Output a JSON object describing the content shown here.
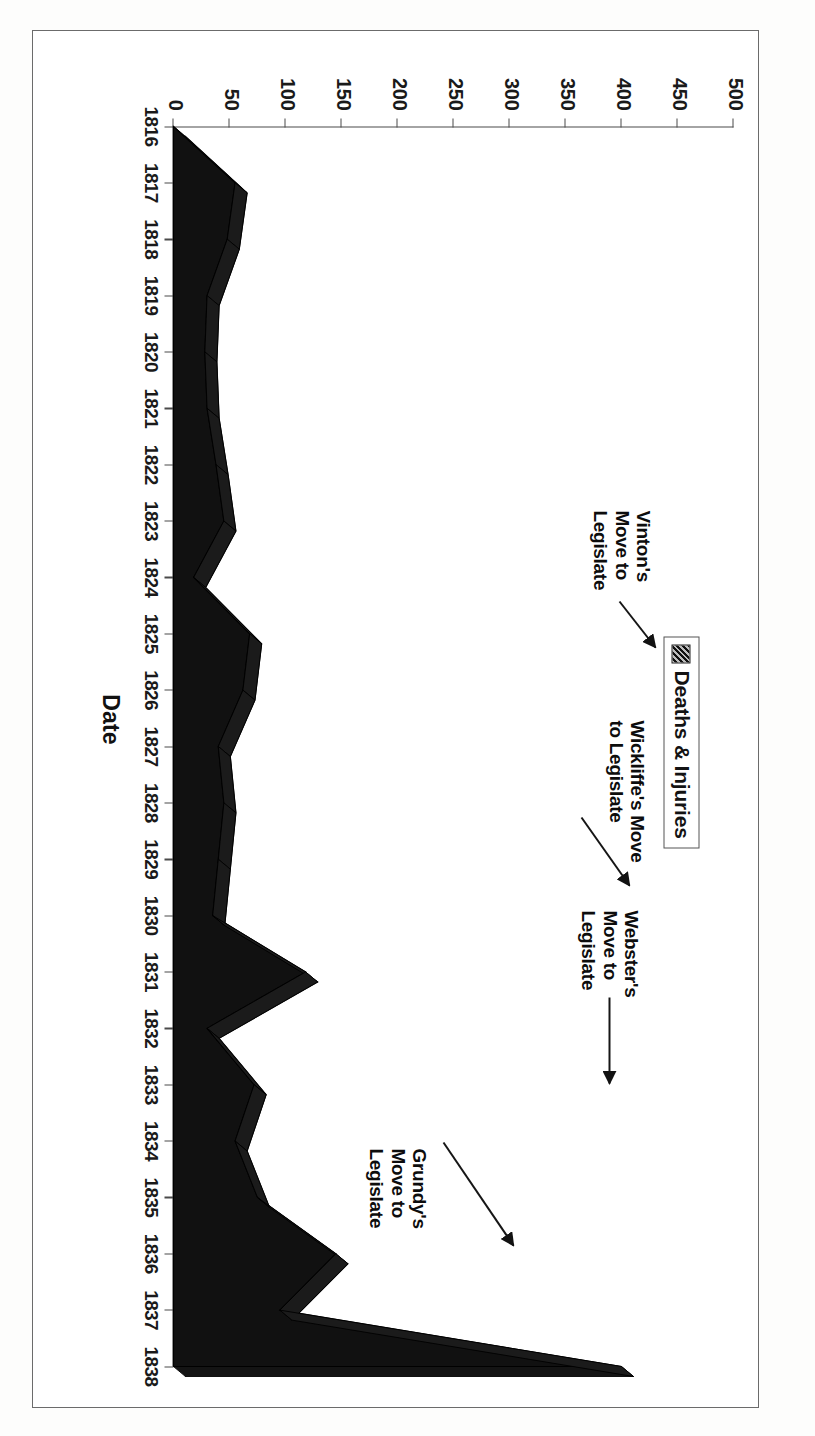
{
  "figure": {
    "background": "#ffffff",
    "frame_color": "#6b6b6b",
    "orientation_note": "chart rendered rotated 90 degrees on the page"
  },
  "legend": {
    "position": "top-right",
    "swatch_name": "hatched-black-swatch",
    "entries": [
      "Deaths & Injuries"
    ],
    "entry_label": "Deaths & Injuries"
  },
  "annotations": [
    {
      "id": "grundy",
      "text": "Grundy's\nMove to\nLegislate",
      "target_year": 1838
    },
    {
      "id": "webster",
      "text": "Webster's\nMove to\nLegislate",
      "target_year": 1833
    },
    {
      "id": "wickliffe",
      "text": "Wickliffe's Move\nto Legislate",
      "target_year": 1831
    },
    {
      "id": "vinton",
      "text": "Vinton's\nMove to\nLegislate",
      "target_year": 1825
    }
  ],
  "chart_data": {
    "type": "area",
    "title": "",
    "xlabel": "Date",
    "ylabel": "",
    "ylim": [
      0,
      500
    ],
    "yticks": [
      0,
      50,
      100,
      150,
      200,
      250,
      300,
      350,
      400,
      450,
      500
    ],
    "ytick_labels": [
      "0",
      "50",
      "100",
      "150",
      "200",
      "250",
      "300",
      "350",
      "400",
      "450",
      "500"
    ],
    "grid": false,
    "legend_position": "top-right",
    "categories": [
      "1816",
      "1817",
      "1818",
      "1819",
      "1820",
      "1821",
      "1822",
      "1823",
      "1824",
      "1825",
      "1826",
      "1827",
      "1828",
      "1829",
      "1830",
      "1831",
      "1832",
      "1833",
      "1834",
      "1835",
      "1836",
      "1837",
      "1838"
    ],
    "series": [
      {
        "name": "Deaths & Injuries",
        "values": [
          0,
          55,
          48,
          30,
          28,
          30,
          38,
          45,
          18,
          68,
          62,
          40,
          45,
          40,
          35,
          118,
          30,
          72,
          55,
          75,
          145,
          95,
          400
        ]
      }
    ]
  }
}
